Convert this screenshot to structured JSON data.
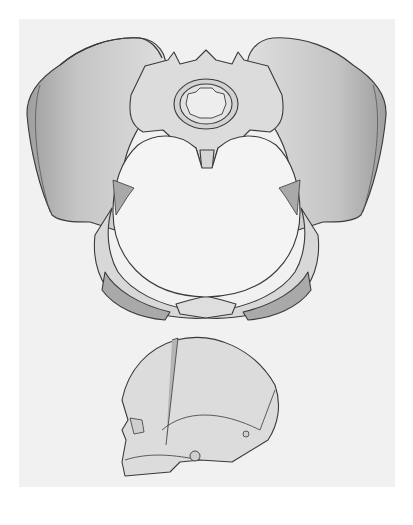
{
  "figure": {
    "labels": [],
    "colors": {
      "background": "#ffffff",
      "panel": "#f1f1f1",
      "bone_fill": "#dcdcdc",
      "bone_shadow": "#a9a9a9",
      "outline": "#3a3a3a",
      "inlet": "#f4f4f4"
    },
    "parts": [
      {
        "id": "pelvis",
        "name": "Pelvis"
      },
      {
        "id": "left-ilium",
        "name": "Left iliac wing"
      },
      {
        "id": "right-ilium",
        "name": "Right iliac wing"
      },
      {
        "id": "sacrum",
        "name": "Sacrum"
      },
      {
        "id": "vertebra",
        "name": "Lumbar vertebra"
      },
      {
        "id": "coccyx",
        "name": "Coccyx"
      },
      {
        "id": "pubic-symphysis",
        "name": "Pubic symphysis"
      },
      {
        "id": "obturator-foramina",
        "name": "Obturator foramina"
      },
      {
        "id": "pelvic-inlet",
        "name": "Pelvic inlet"
      },
      {
        "id": "fetal-skull",
        "name": "Fetal skull"
      }
    ]
  }
}
